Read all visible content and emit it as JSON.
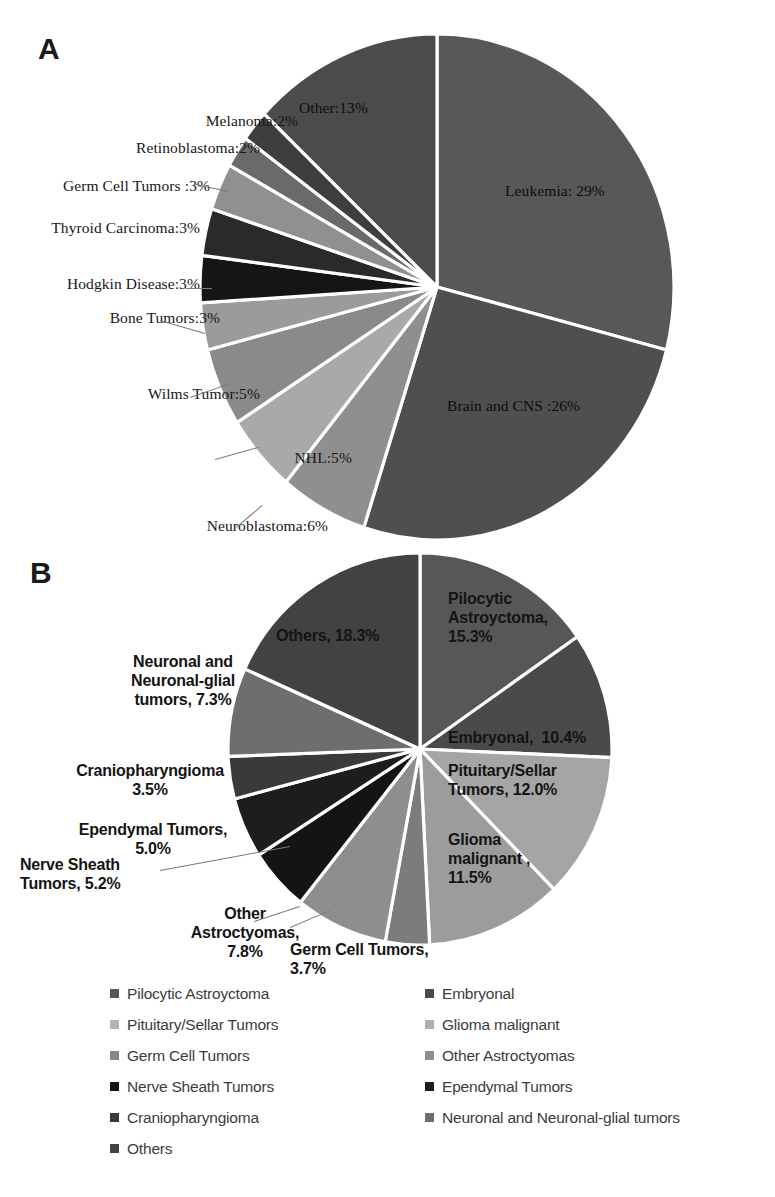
{
  "figure": {
    "panel_a_letter": "A",
    "panel_b_letter": "B"
  },
  "chart_data": [
    {
      "id": "panel-a",
      "type": "pie",
      "title": "A",
      "unit": "%",
      "start_angle_deg": 0,
      "direction": "clockwise",
      "categories": [
        "Leukemia",
        "Brain and CNS",
        "Neuroblastoma",
        "NHL",
        "Wilms Tumor",
        "Bone Tumors",
        "Hodgkin Disease",
        "Thyroid Carcinoma",
        "Germ Cell Tumors",
        "Retinoblastoma",
        "Melanoma",
        "Other"
      ],
      "values": [
        29,
        26,
        6,
        5,
        5,
        3,
        3,
        3,
        3,
        2,
        2,
        13
      ],
      "colors": [
        "#585858",
        "#4f4f4f",
        "#8f8f8f",
        "#a9a9a9",
        "#8a8a8a",
        "#9b9b9b",
        "#151515",
        "#2a2a2a",
        "#909090",
        "#6a6a6a",
        "#3e3e3e",
        "#4b4b4b"
      ],
      "labels": [
        {
          "text": "Leukemia: 29%",
          "place": "inside",
          "x": 505,
          "y": 182,
          "align": "left"
        },
        {
          "text": "Brain and CNS :26%",
          "place": "inside",
          "x": 447,
          "y": 397,
          "align": "left"
        },
        {
          "text": "Neuroblastoma:6%",
          "place": "outside",
          "x": 128,
          "y": 517,
          "align": "right",
          "leader": true
        },
        {
          "text": "NHL:5%",
          "place": "outside",
          "x": 152,
          "y": 449,
          "align": "right",
          "leader": true
        },
        {
          "text": "Wilms Tumor:5%",
          "place": "outside",
          "x": 60,
          "y": 385,
          "align": "right",
          "leader": true
        },
        {
          "text": "Bone Tumors:3%",
          "place": "outside",
          "x": 20,
          "y": 309,
          "align": "right",
          "leader": true
        },
        {
          "text": "Hodgkin Disease:3%",
          "place": "outside",
          "x": 0,
          "y": 275,
          "align": "right",
          "leader": true
        },
        {
          "text": "Thyroid Carcinoma:3%",
          "place": "outside",
          "x": 0,
          "y": 219,
          "align": "right",
          "leader": false
        },
        {
          "text": "Germ Cell Tumors :3%",
          "place": "outside",
          "x": 10,
          "y": 177,
          "align": "right",
          "leader": true
        },
        {
          "text": "Retinoblastoma:2%",
          "place": "outside",
          "x": 60,
          "y": 139,
          "align": "right",
          "leader": false
        },
        {
          "text": "Melanoma:2%",
          "place": "outside",
          "x": 98,
          "y": 112,
          "align": "right",
          "leader": false
        },
        {
          "text": "Other:13%",
          "place": "inside",
          "x": 299,
          "y": 99,
          "align": "left"
        }
      ],
      "geometry": {
        "cx": 437,
        "cy": 287,
        "rx": 237,
        "ry": 253
      }
    },
    {
      "id": "panel-b",
      "type": "pie",
      "title": "B",
      "unit": "%",
      "start_angle_deg": 0,
      "direction": "clockwise",
      "categories": [
        "Pilocytic Astroyctoma",
        "Embryonal",
        "Pituitary/Sellar Tumors",
        "Glioma malignant",
        "Germ Cell Tumors",
        "Other Astroctyomas",
        "Nerve Sheath Tumors",
        "Ependymal Tumors",
        "Craniopharyngioma",
        "Neuronal and Neuronal-glial tumors",
        "Others"
      ],
      "values": [
        15.3,
        10.4,
        12.0,
        11.5,
        3.7,
        7.8,
        5.2,
        5.0,
        3.5,
        7.3,
        18.3
      ],
      "colors": [
        "#575757",
        "#4a4a4a",
        "#a5a5a5",
        "#9c9c9c",
        "#7c7c7c",
        "#8e8e8e",
        "#141414",
        "#1d1d1d",
        "#3a3a3a",
        "#6e6e6e",
        "#424242"
      ],
      "labels": [
        {
          "text": "Pilocytic\nAstroyctoma,\n15.3%",
          "place": "inside",
          "x": 448,
          "y": 590,
          "align": "left"
        },
        {
          "text": "Embryonal,  10.4%",
          "place": "inside",
          "x": 448,
          "y": 729,
          "align": "left"
        },
        {
          "text": "Pituitary/Sellar\nTumors, 12.0%",
          "place": "inside",
          "x": 448,
          "y": 762,
          "align": "left"
        },
        {
          "text": "Glioma\nmalignant ,\n11.5%",
          "place": "inside",
          "x": 448,
          "y": 831,
          "align": "left"
        },
        {
          "text": "Germ Cell Tumors,\n3.7%",
          "place": "outside",
          "x": 290,
          "y": 941,
          "align": "left",
          "leader": true
        },
        {
          "text": "Other\nAstroctyomas,\n7.8%",
          "place": "outside",
          "x": 140,
          "y": 905,
          "align": "center",
          "leader": true
        },
        {
          "text": "Nerve Sheath\nTumors, 5.2%",
          "place": "outside",
          "x": 20,
          "y": 856,
          "align": "left",
          "leader": true
        },
        {
          "text": "Ependymal Tumors,\n5.0%",
          "place": "outside",
          "x": 48,
          "y": 821,
          "align": "center",
          "leader": false
        },
        {
          "text": "Craniopharyngioma\n3.5%",
          "place": "outside",
          "x": 45,
          "y": 762,
          "align": "center",
          "leader": false
        },
        {
          "text": "Neuronal and\nNeuronal-glial\ntumors, 7.3%",
          "place": "outside",
          "x": 78,
          "y": 653,
          "align": "center",
          "leader": false
        },
        {
          "text": "Others, 18.3%",
          "place": "inside",
          "x": 276,
          "y": 627,
          "align": "left"
        }
      ],
      "geometry": {
        "cx": 420,
        "cy": 749,
        "rx": 192,
        "ry": 196
      }
    }
  ],
  "legend": {
    "left_column": [
      {
        "label": "Pilocytic Astroyctoma",
        "color": "#575757"
      },
      {
        "label": "Pituitary/Sellar Tumors",
        "color": "#b3b3b3"
      },
      {
        "label": "Germ Cell Tumors",
        "color": "#878787"
      },
      {
        "label": "Nerve Sheath Tumors",
        "color": "#141414"
      },
      {
        "label": "Craniopharyngioma",
        "color": "#3a3a3a"
      },
      {
        "label": "Others",
        "color": "#424242"
      }
    ],
    "right_column": [
      {
        "label": "Embryonal",
        "color": "#4a4a4a"
      },
      {
        "label": "Glioma malignant",
        "color": "#b0b0b0"
      },
      {
        "label": "Other Astroctyomas",
        "color": "#8e8e8e"
      },
      {
        "label": "Ependymal Tumors",
        "color": "#1d1d1d"
      },
      {
        "label": "Neuronal and Neuronal-glial tumors",
        "color": "#6e6e6e"
      }
    ]
  }
}
